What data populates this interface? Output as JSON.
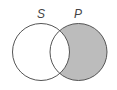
{
  "diagram": {
    "type": "venn",
    "sets": [
      {
        "id": "S",
        "label": "S",
        "shaded": false
      },
      {
        "id": "P",
        "label": "P",
        "shaded": true
      }
    ],
    "shaded_region": "P minus S",
    "colors": {
      "shade": "#bcbcbc",
      "stroke": "#555555",
      "background": "#ffffff"
    }
  }
}
